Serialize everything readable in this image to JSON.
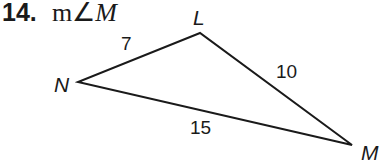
{
  "problem": {
    "number": "14.",
    "prompt_prefix": "m∠",
    "prompt_angle": "M"
  },
  "triangle": {
    "vertices": [
      {
        "name": "L",
        "x": 200,
        "y": 33
      },
      {
        "name": "N",
        "x": 78,
        "y": 82
      },
      {
        "name": "M",
        "x": 352,
        "y": 145
      }
    ],
    "sides": [
      {
        "between": "N-L",
        "length": "7"
      },
      {
        "between": "L-M",
        "length": "10"
      },
      {
        "between": "N-M",
        "length": "15"
      }
    ],
    "stroke_color": "#1a1a1a"
  }
}
